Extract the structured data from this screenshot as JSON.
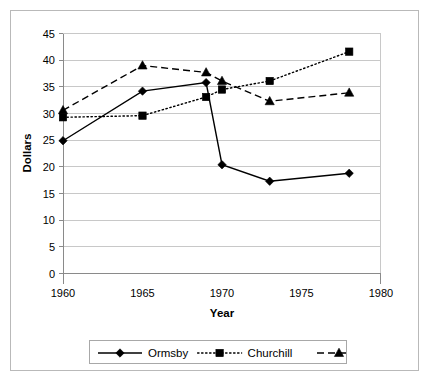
{
  "chart_data": {
    "type": "line",
    "title": "",
    "xlabel": "Year",
    "ylabel": "Dollars",
    "xlim": [
      1960,
      1980
    ],
    "ylim": [
      0,
      45
    ],
    "xticks": [
      1960,
      1965,
      1970,
      1975,
      1980
    ],
    "yticks": [
      0,
      5,
      10,
      15,
      20,
      25,
      30,
      35,
      40,
      45
    ],
    "grid": "horizontal",
    "legend_position": "bottom",
    "series": [
      {
        "name": "Ormsby",
        "marker": "diamond",
        "linestyle": "solid",
        "color": "#000000",
        "x": [
          1960,
          1965,
          1969,
          1970,
          1973,
          1978
        ],
        "values": [
          24.8,
          34.1,
          35.7,
          20.3,
          17.2,
          18.7
        ]
      },
      {
        "name": "Churchill",
        "marker": "square",
        "linestyle": "dotted",
        "color": "#000000",
        "x": [
          1960,
          1965,
          1969,
          1970,
          1973,
          1978
        ],
        "values": [
          29.2,
          29.5,
          33.0,
          34.4,
          36.0,
          41.5
        ]
      },
      {
        "name": "Elko",
        "marker": "triangle",
        "linestyle": "dashed",
        "color": "#000000",
        "x": [
          1960,
          1965,
          1969,
          1970,
          1973,
          1978
        ],
        "values": [
          30.5,
          38.9,
          37.6,
          36.0,
          32.2,
          33.8
        ]
      }
    ]
  },
  "legend": {
    "entries": [
      {
        "label": "Ormsby"
      },
      {
        "label": "Churchill"
      },
      {
        "label": "Elko"
      }
    ]
  },
  "axes": {
    "x_title": "Year",
    "y_title": "Dollars",
    "x_tick_labels": [
      "1960",
      "1965",
      "1970",
      "1975",
      "1980"
    ],
    "y_tick_labels": [
      "0",
      "5",
      "10",
      "15",
      "20",
      "25",
      "30",
      "35",
      "40",
      "45"
    ]
  }
}
